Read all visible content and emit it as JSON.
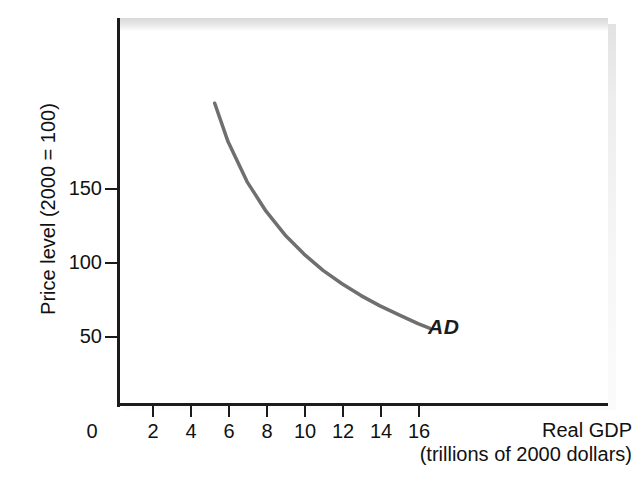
{
  "figure": {
    "caption_remnant": "",
    "series_label": "AD"
  },
  "chart_data": {
    "type": "line",
    "title": "",
    "subtitle": "",
    "xlabel": "Real GDP",
    "xlabel_units": "(trillions of 2000 dollars)",
    "ylabel": "Price level (2000 = 100)",
    "xlim": [
      0,
      22
    ],
    "ylim": [
      0,
      230
    ],
    "xticks": [
      0,
      2,
      4,
      6,
      8,
      10,
      12,
      14,
      16
    ],
    "xtick_labels": [
      "0",
      "2",
      "4",
      "6",
      "8",
      "10",
      "12",
      "14",
      "16"
    ],
    "yticks": [
      50,
      100,
      150
    ],
    "ytick_labels": [
      "50",
      "100",
      "150"
    ],
    "grid": false,
    "legend_position": "inline-right-end",
    "series": [
      {
        "name": "AD",
        "label": "AD",
        "color": "#6f6f6f",
        "linewidth": 3.5,
        "annotation": "AD",
        "x": [
          5.3,
          6.0,
          7.0,
          8.0,
          9.0,
          10.0,
          11.0,
          12.0,
          13.0,
          14.0,
          15.0,
          16.0,
          16.6
        ],
        "y": [
          208,
          182,
          155,
          135,
          119,
          106,
          95,
          86,
          78,
          71,
          65,
          59,
          56
        ]
      }
    ]
  },
  "colors": {
    "curve": "#6f6f6f",
    "axis": "#1b1b1b",
    "text": "#111111",
    "background": "#ffffff",
    "shadow": "#e4e4e4"
  }
}
